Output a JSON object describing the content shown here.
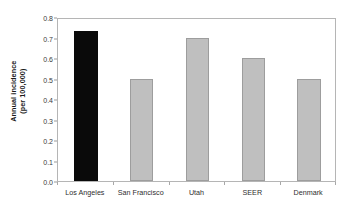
{
  "chart_data": {
    "type": "bar",
    "title": "",
    "subtitle": "",
    "xlabel": "",
    "ylabel_lines": [
      "Annual incidence",
      "(per 100,000)"
    ],
    "ylabel": "Annual incidence (per 100,000)",
    "categories": [
      "Los Angeles",
      "San Francisco",
      "Utah",
      "SEER",
      "Denmark"
    ],
    "values": [
      0.73,
      0.5,
      0.7,
      0.6,
      0.5
    ],
    "ylim": [
      0.0,
      0.8
    ],
    "ytick_values": [
      0.0,
      0.1,
      0.2,
      0.3,
      0.4,
      0.5,
      0.6,
      0.7,
      0.8
    ],
    "ytick_labels": [
      "0.0",
      "0.1",
      "0.2",
      "0.3",
      "0.4",
      "0.5",
      "0.6",
      "0.7",
      "0.8"
    ],
    "grid": false,
    "legend": "none",
    "bar_colors": [
      "#0a0a0a",
      "#bfbfbf",
      "#bfbfbf",
      "#bfbfbf",
      "#bfbfbf"
    ],
    "bar_border_colors": [
      "#0a0a0a",
      "#9d9d9d",
      "#9d9d9d",
      "#9d9d9d",
      "#9d9d9d"
    ],
    "highlight_category": "Los Angeles",
    "colors": {
      "background": "#ffffff",
      "frame": "#b5b5b5",
      "tick": "#9a9a9a",
      "text": "#2e2e2e",
      "accent": "#0a0a0a",
      "bar_fill": "#bfbfbf"
    }
  }
}
